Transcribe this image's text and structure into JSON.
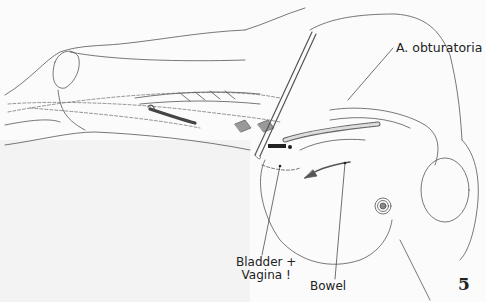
{
  "figure": {
    "number": "5",
    "labels": {
      "artery": "A. obturatoria",
      "bladder_line1": "Bladder +",
      "bladder_line2": "Vagina !",
      "bowel": "Bowel"
    },
    "colors": {
      "line": "#555555",
      "background": "#fbfbfb",
      "text": "#222222"
    }
  }
}
